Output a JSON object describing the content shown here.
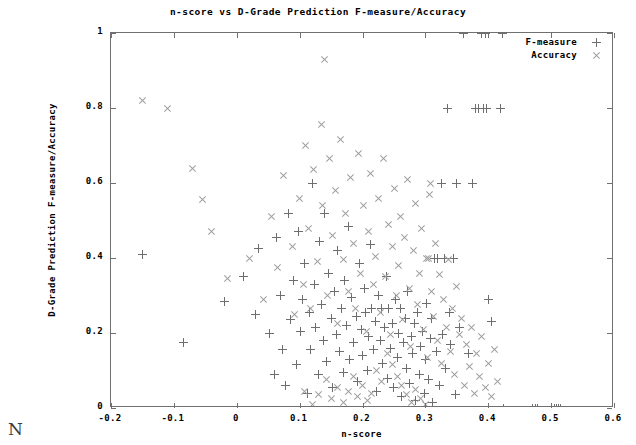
{
  "chart_data": {
    "type": "scatter",
    "title": "n-score vs D-Grade Prediction F-measure/Accuracy",
    "xlabel": "n-score",
    "ylabel": "D-Grade Prediction F-measure/Accuracy",
    "xlim": [
      -0.2,
      0.6
    ],
    "ylim": [
      0,
      1
    ],
    "xticks": [
      -0.2,
      -0.1,
      0,
      0.1,
      0.2,
      0.3,
      0.4,
      0.5,
      0.6
    ],
    "xticklabels": [
      "-0.2",
      "-0.1",
      "0",
      "0.1",
      "0.2",
      "0.3",
      "0.4",
      "0.5",
      "0.6"
    ],
    "yticks": [
      0,
      0.2,
      0.4,
      0.6,
      0.8,
      1
    ],
    "yticklabels": [
      "0",
      "0.2",
      "0.4",
      "0.6",
      "0.8",
      "1"
    ],
    "grid": false,
    "legend_position": "top-right",
    "series": [
      {
        "name": "F-measure",
        "marker": "plus",
        "color": "#6e6e6e",
        "points": [
          [
            -0.15,
            0.41
          ],
          [
            -0.085,
            0.175
          ],
          [
            -0.02,
            0.285
          ],
          [
            0.01,
            0.35
          ],
          [
            0.03,
            0.25
          ],
          [
            0.035,
            0.425
          ],
          [
            0.052,
            0.2
          ],
          [
            0.06,
            0.09
          ],
          [
            0.063,
            0.455
          ],
          [
            0.07,
            0.3
          ],
          [
            0.072,
            0.155
          ],
          [
            0.078,
            0.06
          ],
          [
            0.082,
            0.52
          ],
          [
            0.085,
            0.235
          ],
          [
            0.09,
            0.34
          ],
          [
            0.095,
            0.115
          ],
          [
            0.098,
            0.47
          ],
          [
            0.102,
            0.205
          ],
          [
            0.105,
            0.29
          ],
          [
            0.108,
            0.385
          ],
          [
            0.112,
            0.04
          ],
          [
            0.115,
            0.255
          ],
          [
            0.118,
            0.155
          ],
          [
            0.12,
            0.6
          ],
          [
            0.123,
            0.33
          ],
          [
            0.126,
            0.215
          ],
          [
            0.13,
            0.09
          ],
          [
            0.132,
            0.445
          ],
          [
            0.135,
            0.275
          ],
          [
            0.138,
            0.18
          ],
          [
            0.14,
            0.52
          ],
          [
            0.143,
            0.125
          ],
          [
            0.146,
            0.36
          ],
          [
            0.15,
            0.24
          ],
          [
            0.152,
            0.055
          ],
          [
            0.155,
            0.31
          ],
          [
            0.158,
            0.195
          ],
          [
            0.16,
            0.42
          ],
          [
            0.163,
            0.15
          ],
          [
            0.166,
            0.265
          ],
          [
            0.17,
            0.095
          ],
          [
            0.172,
            0.34
          ],
          [
            0.175,
            0.22
          ],
          [
            0.178,
            0.485
          ],
          [
            0.18,
            0.13
          ],
          [
            0.183,
            0.295
          ],
          [
            0.186,
            0.175
          ],
          [
            0.19,
            0.245
          ],
          [
            0.192,
            0.07
          ],
          [
            0.195,
            0.385
          ],
          [
            0.198,
            0.21
          ],
          [
            0.2,
            0.14
          ],
          [
            0.203,
            0.32
          ],
          [
            0.205,
            0.255
          ],
          [
            0.208,
            0.1
          ],
          [
            0.21,
            0.19
          ],
          [
            0.212,
            0.435
          ],
          [
            0.215,
            0.265
          ],
          [
            0.218,
            0.155
          ],
          [
            0.22,
            0.23
          ],
          [
            0.222,
            0.045
          ],
          [
            0.225,
            0.3
          ],
          [
            0.228,
            0.18
          ],
          [
            0.23,
            0.265
          ],
          [
            0.232,
            0.12
          ],
          [
            0.235,
            0.215
          ],
          [
            0.238,
            0.35
          ],
          [
            0.24,
            0.08
          ],
          [
            0.242,
            0.265
          ],
          [
            0.245,
            0.16
          ],
          [
            0.248,
            0.225
          ],
          [
            0.25,
            0.055
          ],
          [
            0.252,
            0.29
          ],
          [
            0.255,
            0.135
          ],
          [
            0.258,
            0.2
          ],
          [
            0.26,
            0.265
          ],
          [
            0.262,
            0.03
          ],
          [
            0.265,
            0.175
          ],
          [
            0.268,
            0.24
          ],
          [
            0.27,
            0.105
          ],
          [
            0.272,
            0.31
          ],
          [
            0.275,
            0.065
          ],
          [
            0.278,
            0.19
          ],
          [
            0.28,
            0.145
          ],
          [
            0.282,
            0.225
          ],
          [
            0.285,
            0.02
          ],
          [
            0.288,
            0.255
          ],
          [
            0.29,
            0.09
          ],
          [
            0.292,
            0.165
          ],
          [
            0.295,
            0.205
          ],
          [
            0.298,
            0.04
          ],
          [
            0.3,
            0.13
          ],
          [
            0.302,
            0.28
          ],
          [
            0.305,
            0.075
          ],
          [
            0.308,
            0.185
          ],
          [
            0.31,
            0.24
          ],
          [
            0.312,
            0.015
          ],
          [
            0.315,
            0.4
          ],
          [
            0.318,
            0.15
          ],
          [
            0.32,
            0.4
          ],
          [
            0.322,
            0.06
          ],
          [
            0.325,
            0.6
          ],
          [
            0.328,
            0.195
          ],
          [
            0.33,
            0.4
          ],
          [
            0.332,
            0.105
          ],
          [
            0.335,
            0.8
          ],
          [
            0.338,
            0.255
          ],
          [
            0.34,
            0.17
          ],
          [
            0.345,
            0.4
          ],
          [
            0.348,
            0.035
          ],
          [
            0.35,
            0.6
          ],
          [
            0.355,
            0.215
          ],
          [
            0.36,
            1.0
          ],
          [
            0.368,
            0.145
          ],
          [
            0.375,
            0.6
          ],
          [
            0.38,
            0.8
          ],
          [
            0.385,
            0.8
          ],
          [
            0.39,
            1.0
          ],
          [
            0.392,
            0.8
          ],
          [
            0.395,
            1.0
          ],
          [
            0.398,
            0.8
          ],
          [
            0.4,
            0.29
          ],
          [
            0.405,
            0.23
          ],
          [
            0.42,
            0.8
          ],
          [
            0.422,
            1.0
          ],
          [
            0.425,
            0.0
          ],
          [
            0.47,
            0.0
          ],
          [
            0.475,
            0.0
          ],
          [
            0.478,
            0.0
          ],
          [
            0.5,
            0.0
          ],
          [
            0.505,
            0.0
          ],
          [
            0.508,
            0.0
          ],
          [
            0.512,
            0.0
          ],
          [
            0.515,
            0.0
          ]
        ]
      },
      {
        "name": "Accuracy",
        "marker": "cross",
        "color": "#9e9e9e",
        "points": [
          [
            -0.15,
            0.82
          ],
          [
            -0.11,
            0.8
          ],
          [
            -0.07,
            0.64
          ],
          [
            -0.055,
            0.555
          ],
          [
            -0.04,
            0.47
          ],
          [
            -0.015,
            0.345
          ],
          [
            0.02,
            0.4
          ],
          [
            0.042,
            0.29
          ],
          [
            0.055,
            0.51
          ],
          [
            0.065,
            0.375
          ],
          [
            0.075,
            0.62
          ],
          [
            0.088,
            0.43
          ],
          [
            0.092,
            0.25
          ],
          [
            0.1,
            0.56
          ],
          [
            0.106,
            0.33
          ],
          [
            0.11,
            0.7
          ],
          [
            0.114,
            0.48
          ],
          [
            0.118,
            0.265
          ],
          [
            0.122,
            0.635
          ],
          [
            0.128,
            0.39
          ],
          [
            0.134,
            0.755
          ],
          [
            0.137,
            0.54
          ],
          [
            0.14,
            0.93
          ],
          [
            0.144,
            0.3
          ],
          [
            0.148,
            0.665
          ],
          [
            0.153,
            0.46
          ],
          [
            0.157,
            0.58
          ],
          [
            0.161,
            0.225
          ],
          [
            0.165,
            0.715
          ],
          [
            0.169,
            0.395
          ],
          [
            0.173,
            0.52
          ],
          [
            0.177,
            0.31
          ],
          [
            0.181,
            0.615
          ],
          [
            0.185,
            0.44
          ],
          [
            0.189,
            0.265
          ],
          [
            0.193,
            0.68
          ],
          [
            0.197,
            0.36
          ],
          [
            0.201,
            0.54
          ],
          [
            0.206,
            0.205
          ],
          [
            0.209,
            0.47
          ],
          [
            0.213,
            0.625
          ],
          [
            0.217,
            0.33
          ],
          [
            0.221,
            0.405
          ],
          [
            0.226,
            0.56
          ],
          [
            0.229,
            0.255
          ],
          [
            0.233,
            0.665
          ],
          [
            0.237,
            0.35
          ],
          [
            0.241,
            0.49
          ],
          [
            0.244,
            0.195
          ],
          [
            0.247,
            0.43
          ],
          [
            0.251,
            0.585
          ],
          [
            0.254,
            0.3
          ],
          [
            0.257,
            0.38
          ],
          [
            0.261,
            0.51
          ],
          [
            0.264,
            0.235
          ],
          [
            0.267,
            0.455
          ],
          [
            0.271,
            0.61
          ],
          [
            0.274,
            0.32
          ],
          [
            0.277,
            0.165
          ],
          [
            0.281,
            0.42
          ],
          [
            0.284,
            0.545
          ],
          [
            0.287,
            0.275
          ],
          [
            0.291,
            0.36
          ],
          [
            0.294,
            0.48
          ],
          [
            0.297,
            0.21
          ],
          [
            0.301,
            0.4
          ],
          [
            0.304,
            0.135
          ],
          [
            0.306,
            0.57
          ],
          [
            0.309,
            0.31
          ],
          [
            0.313,
            0.245
          ],
          [
            0.316,
            0.44
          ],
          [
            0.319,
            0.18
          ],
          [
            0.322,
            0.355
          ],
          [
            0.326,
            0.12
          ],
          [
            0.329,
            0.29
          ],
          [
            0.333,
            0.215
          ],
          [
            0.336,
            0.395
          ],
          [
            0.34,
            0.15
          ],
          [
            0.343,
            0.265
          ],
          [
            0.347,
            0.09
          ],
          [
            0.35,
            0.325
          ],
          [
            0.354,
            0.195
          ],
          [
            0.358,
            0.24
          ],
          [
            0.362,
            0.06
          ],
          [
            0.365,
            0.17
          ],
          [
            0.37,
            0.11
          ],
          [
            0.374,
            0.215
          ],
          [
            0.378,
            0.04
          ],
          [
            0.382,
            0.145
          ],
          [
            0.386,
            0.085
          ],
          [
            0.39,
            0.19
          ],
          [
            0.395,
            0.055
          ],
          [
            0.4,
            0.12
          ],
          [
            0.405,
            0.03
          ],
          [
            0.41,
            0.155
          ],
          [
            0.415,
            0.07
          ],
          [
            0.305,
            0.4
          ],
          [
            0.308,
            0.6
          ],
          [
            0.24,
            0.145
          ],
          [
            0.248,
            0.115
          ],
          [
            0.255,
            0.085
          ],
          [
            0.262,
            0.06
          ],
          [
            0.27,
            0.035
          ],
          [
            0.278,
            0.015
          ],
          [
            0.285,
            0.05
          ],
          [
            0.292,
            0.025
          ],
          [
            0.3,
            0.01
          ],
          [
            0.23,
            0.07
          ],
          [
            0.222,
            0.1
          ],
          [
            0.215,
            0.04
          ],
          [
            0.208,
            0.02
          ],
          [
            0.2,
            0.06
          ],
          [
            0.192,
            0.03
          ],
          [
            0.185,
            0.085
          ],
          [
            0.178,
            0.045
          ],
          [
            0.17,
            0.015
          ],
          [
            0.16,
            0.055
          ],
          [
            0.15,
            0.025
          ],
          [
            0.142,
            0.075
          ],
          [
            0.13,
            0.035
          ],
          [
            0.12,
            0.01
          ],
          [
            0.108,
            0.045
          ]
        ]
      }
    ]
  },
  "legend": {
    "entries": [
      {
        "label": "F-measure",
        "marker": "+"
      },
      {
        "label": "Accuracy",
        "marker": "×"
      }
    ]
  },
  "page": {
    "stray_glyph": "N"
  },
  "colors": {
    "frame": "#707070",
    "fmeasure": "#6e6e6e",
    "accuracy": "#9e9e9e",
    "text": "#000000",
    "background": "#ffffff"
  }
}
